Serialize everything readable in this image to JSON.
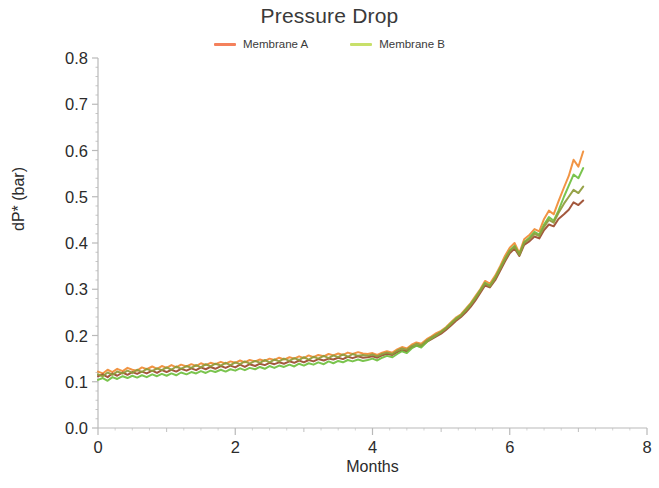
{
  "chart": {
    "title": "Pressure Drop",
    "xlabel": "Months",
    "ylabel": "dP* (bar)"
  },
  "legend": {
    "position": "top-center",
    "entries": [
      {
        "label": "Membrane A",
        "color": "#F4815C"
      },
      {
        "label": "Membrane B",
        "color": "#C8E06A"
      }
    ]
  },
  "axes": {
    "y_ticks": [
      "0.0",
      "0.1",
      "0.2",
      "0.3",
      "0.4",
      "0.5",
      "0.6",
      "0.7",
      "0.8"
    ],
    "x_ticks": [
      "0",
      "2",
      "4",
      "6",
      "8"
    ],
    "x_minor_ticks": [
      "1",
      "3",
      "5",
      "7"
    ],
    "x_range": [
      0,
      8
    ],
    "y_range": [
      0.0,
      0.8
    ],
    "grid": false,
    "axis_color": "#b9b9b9"
  },
  "colors": {
    "orange": "#F08B34",
    "green": "#6FBF3F",
    "dark_red": "#9B4A2C",
    "olive": "#8E9B3A"
  },
  "chart_data": {
    "type": "line",
    "title": "Pressure Drop",
    "xlabel": "Months",
    "ylabel": "dP* (bar)",
    "xlim": [
      0,
      8
    ],
    "ylim": [
      0.0,
      0.8
    ],
    "grid": false,
    "legend_position": "top-center",
    "x": [
      0.0,
      0.07,
      0.14,
      0.21,
      0.28,
      0.36,
      0.43,
      0.5,
      0.57,
      0.64,
      0.71,
      0.79,
      0.86,
      0.93,
      1.0,
      1.07,
      1.14,
      1.21,
      1.29,
      1.36,
      1.43,
      1.5,
      1.57,
      1.64,
      1.71,
      1.79,
      1.86,
      1.93,
      2.0,
      2.07,
      2.14,
      2.21,
      2.29,
      2.36,
      2.43,
      2.5,
      2.57,
      2.64,
      2.71,
      2.79,
      2.86,
      2.93,
      3.0,
      3.07,
      3.14,
      3.21,
      3.29,
      3.36,
      3.43,
      3.5,
      3.57,
      3.64,
      3.71,
      3.79,
      3.86,
      3.93,
      4.0,
      4.07,
      4.14,
      4.21,
      4.29,
      4.36,
      4.43,
      4.5,
      4.57,
      4.64,
      4.71,
      4.79,
      4.86,
      4.93,
      5.0,
      5.07,
      5.14,
      5.21,
      5.29,
      5.36,
      5.43,
      5.5,
      5.57,
      5.64,
      5.71,
      5.79,
      5.86,
      5.93,
      6.0,
      6.07,
      6.14,
      6.21,
      6.29,
      6.36,
      6.43,
      6.5,
      6.57,
      6.64,
      6.71,
      6.79,
      6.86,
      6.93,
      7.0,
      7.07
    ],
    "series": [
      {
        "name": "Membrane A - trace 1",
        "legend": "Membrane A",
        "color": "#F08B34",
        "values": [
          0.122,
          0.118,
          0.126,
          0.121,
          0.128,
          0.123,
          0.13,
          0.126,
          0.124,
          0.131,
          0.127,
          0.133,
          0.128,
          0.134,
          0.13,
          0.136,
          0.131,
          0.137,
          0.133,
          0.138,
          0.134,
          0.14,
          0.136,
          0.141,
          0.138,
          0.143,
          0.139,
          0.144,
          0.141,
          0.146,
          0.142,
          0.147,
          0.144,
          0.148,
          0.145,
          0.15,
          0.147,
          0.152,
          0.148,
          0.153,
          0.15,
          0.155,
          0.151,
          0.157,
          0.153,
          0.158,
          0.155,
          0.16,
          0.157,
          0.161,
          0.158,
          0.163,
          0.16,
          0.164,
          0.161,
          0.16,
          0.162,
          0.158,
          0.163,
          0.166,
          0.163,
          0.17,
          0.175,
          0.172,
          0.18,
          0.185,
          0.182,
          0.192,
          0.198,
          0.205,
          0.21,
          0.218,
          0.228,
          0.238,
          0.246,
          0.258,
          0.27,
          0.285,
          0.3,
          0.318,
          0.312,
          0.33,
          0.35,
          0.372,
          0.39,
          0.4,
          0.378,
          0.408,
          0.418,
          0.43,
          0.425,
          0.452,
          0.47,
          0.462,
          0.49,
          0.52,
          0.545,
          0.58,
          0.565,
          0.598
        ]
      },
      {
        "name": "Membrane A - trace 2",
        "legend": "Membrane A",
        "color": "#9B4A2C",
        "values": [
          0.112,
          0.116,
          0.11,
          0.118,
          0.113,
          0.12,
          0.115,
          0.121,
          0.117,
          0.122,
          0.118,
          0.124,
          0.119,
          0.125,
          0.121,
          0.126,
          0.122,
          0.128,
          0.124,
          0.129,
          0.125,
          0.131,
          0.127,
          0.132,
          0.128,
          0.134,
          0.13,
          0.135,
          0.131,
          0.137,
          0.132,
          0.138,
          0.134,
          0.139,
          0.136,
          0.141,
          0.138,
          0.142,
          0.139,
          0.144,
          0.141,
          0.146,
          0.142,
          0.147,
          0.144,
          0.149,
          0.146,
          0.15,
          0.148,
          0.152,
          0.149,
          0.154,
          0.151,
          0.155,
          0.152,
          0.153,
          0.155,
          0.152,
          0.157,
          0.16,
          0.158,
          0.164,
          0.168,
          0.166,
          0.174,
          0.178,
          0.176,
          0.186,
          0.192,
          0.198,
          0.204,
          0.212,
          0.221,
          0.231,
          0.24,
          0.25,
          0.262,
          0.276,
          0.292,
          0.308,
          0.304,
          0.32,
          0.34,
          0.36,
          0.378,
          0.388,
          0.372,
          0.396,
          0.404,
          0.414,
          0.41,
          0.428,
          0.44,
          0.436,
          0.452,
          0.462,
          0.472,
          0.488,
          0.482,
          0.492
        ]
      },
      {
        "name": "Membrane B - trace 1",
        "legend": "Membrane B",
        "color": "#6FBF3F",
        "values": [
          0.104,
          0.108,
          0.102,
          0.11,
          0.106,
          0.112,
          0.108,
          0.113,
          0.109,
          0.114,
          0.11,
          0.116,
          0.112,
          0.117,
          0.113,
          0.118,
          0.114,
          0.12,
          0.116,
          0.121,
          0.118,
          0.123,
          0.119,
          0.124,
          0.121,
          0.126,
          0.122,
          0.127,
          0.124,
          0.129,
          0.125,
          0.13,
          0.127,
          0.132,
          0.128,
          0.134,
          0.13,
          0.135,
          0.132,
          0.137,
          0.133,
          0.139,
          0.135,
          0.14,
          0.137,
          0.142,
          0.138,
          0.144,
          0.14,
          0.145,
          0.142,
          0.147,
          0.144,
          0.148,
          0.145,
          0.147,
          0.15,
          0.146,
          0.152,
          0.156,
          0.153,
          0.16,
          0.166,
          0.162,
          0.172,
          0.178,
          0.174,
          0.186,
          0.194,
          0.2,
          0.208,
          0.216,
          0.226,
          0.236,
          0.244,
          0.256,
          0.268,
          0.282,
          0.298,
          0.314,
          0.308,
          0.326,
          0.346,
          0.366,
          0.384,
          0.394,
          0.376,
          0.402,
          0.412,
          0.424,
          0.418,
          0.44,
          0.456,
          0.448,
          0.47,
          0.5,
          0.524,
          0.548,
          0.54,
          0.562
        ]
      },
      {
        "name": "Membrane B - trace 2",
        "legend": "Membrane B",
        "color": "#8E9B3A",
        "values": [
          0.116,
          0.112,
          0.12,
          0.115,
          0.122,
          0.118,
          0.124,
          0.119,
          0.126,
          0.121,
          0.128,
          0.123,
          0.129,
          0.125,
          0.131,
          0.126,
          0.133,
          0.128,
          0.134,
          0.13,
          0.136,
          0.131,
          0.138,
          0.133,
          0.139,
          0.135,
          0.141,
          0.136,
          0.142,
          0.138,
          0.144,
          0.139,
          0.145,
          0.141,
          0.147,
          0.142,
          0.148,
          0.144,
          0.15,
          0.145,
          0.151,
          0.147,
          0.153,
          0.148,
          0.154,
          0.15,
          0.156,
          0.151,
          0.157,
          0.153,
          0.159,
          0.154,
          0.16,
          0.156,
          0.158,
          0.156,
          0.159,
          0.155,
          0.16,
          0.163,
          0.16,
          0.167,
          0.172,
          0.169,
          0.177,
          0.182,
          0.179,
          0.189,
          0.196,
          0.202,
          0.207,
          0.215,
          0.224,
          0.234,
          0.243,
          0.254,
          0.266,
          0.28,
          0.296,
          0.312,
          0.306,
          0.324,
          0.344,
          0.364,
          0.382,
          0.392,
          0.374,
          0.4,
          0.409,
          0.42,
          0.415,
          0.435,
          0.45,
          0.444,
          0.465,
          0.485,
          0.5,
          0.515,
          0.508,
          0.522
        ]
      }
    ]
  }
}
